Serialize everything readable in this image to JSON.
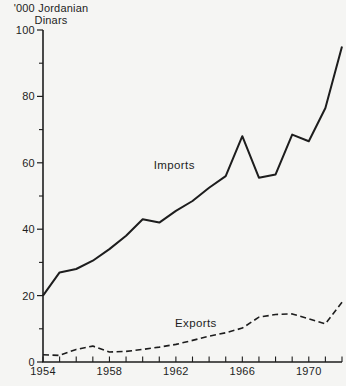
{
  "figure": {
    "background": "#f5f5f3",
    "line_color": "#1d1d1d"
  },
  "chart_data": {
    "type": "line",
    "title": "'000 Jordanian Dinars",
    "title_lines": [
      "'000 Jordanian",
      "Dinars"
    ],
    "xlabel": "",
    "ylabel": "'000 Jordanian Dinars",
    "xlim": [
      1954,
      1972
    ],
    "ylim": [
      0,
      100
    ],
    "grid": false,
    "legend": "inline-labels",
    "x": [
      1954,
      1955,
      1956,
      1957,
      1958,
      1959,
      1960,
      1961,
      1962,
      1963,
      1964,
      1965,
      1966,
      1967,
      1968,
      1969,
      1970,
      1971,
      1972
    ],
    "series": [
      {
        "name": "Imports",
        "line_style": "solid",
        "values": [
          20,
          27,
          28,
          30.5,
          34,
          38,
          43,
          42,
          45.5,
          48.5,
          52.5,
          56,
          68,
          55.5,
          56.5,
          68.5,
          66.5,
          76.5,
          95
        ]
      },
      {
        "name": "Exports",
        "line_style": "dashed",
        "values": [
          2.2,
          2,
          3.8,
          4.8,
          3,
          3.2,
          3.8,
          4.5,
          5.3,
          6.5,
          7.8,
          8.8,
          10.2,
          13.5,
          14.3,
          14.5,
          13,
          11.5,
          18
        ]
      }
    ],
    "x_tick_interval": 1,
    "x_label_ticks": [
      1954,
      1958,
      1962,
      1966,
      1970
    ],
    "y_major_ticks": [
      0,
      20,
      40,
      60,
      80,
      100
    ],
    "y_minor_ticks": [
      10,
      30,
      50,
      70,
      90
    ],
    "annotations": [
      {
        "text": "Imports",
        "x": 1961.9,
        "y": 58
      },
      {
        "text": "Exports",
        "x": 1963.2,
        "y": 10.5
      }
    ]
  }
}
